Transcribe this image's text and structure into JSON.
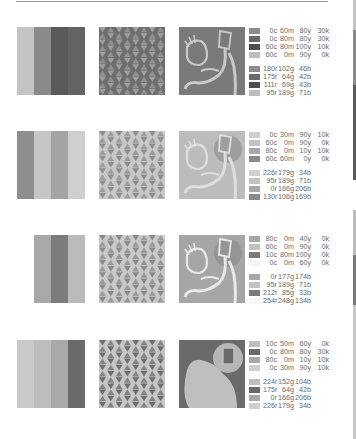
{
  "palettes": [
    {
      "name": "palette-1",
      "stripes": [
        "#c4c4c4",
        "#8a8a8a",
        "#5a5a5a",
        "#646464"
      ],
      "stripe_left": 17,
      "stripe_widths": [
        17,
        17,
        17,
        17
      ],
      "pattern_bg": "#6e6e6e",
      "pattern_fg": "#9e9e9e",
      "figure_bg": "#7a7a7a",
      "figure_fg": "#c8c8c8",
      "cmyk": [
        {
          "swatch": "#8c8c8c",
          "c": "0c",
          "m": "60m",
          "y": "80y",
          "k": "30k"
        },
        {
          "swatch": "#6a6a6a",
          "c": "0c",
          "m": "80m",
          "y": "80y",
          "k": "30k"
        },
        {
          "swatch": "#4e4e4e",
          "c": "60c",
          "m": "80m",
          "y": "100y",
          "k": "10k"
        },
        {
          "swatch": "#bdbdbd",
          "c": "60c",
          "m": "0m",
          "y": "90y",
          "k": "0k"
        }
      ],
      "rgb": [
        {
          "swatch": "#8c8c8c",
          "r": "180r",
          "g": "102g",
          "b": "46b"
        },
        {
          "swatch": "#6a6a6a",
          "r": "175r",
          "g": "64g",
          "b": "42b"
        },
        {
          "swatch": "#4e4e4e",
          "r": "111r",
          "g": "69g",
          "b": "43b"
        },
        {
          "swatch": "#bdbdbd",
          "r": "95r",
          "g": "189g",
          "b": "71b"
        }
      ]
    },
    {
      "name": "palette-2",
      "stripes": [
        "#8e8e8e",
        "#c6c6c6",
        "#a4a4a4",
        "#cfcfcf"
      ],
      "stripe_left": 17,
      "stripe_widths": [
        17,
        17,
        17,
        17
      ],
      "pattern_bg": "#c8c8c8",
      "pattern_fg": "#8e8e8e",
      "figure_bg": "#bcbcbc",
      "figure_fg": "#dedede",
      "cmyk": [
        {
          "swatch": "#cfcfcf",
          "c": "0c",
          "m": "30m",
          "y": "90y",
          "k": "10k"
        },
        {
          "swatch": "#c2c2c2",
          "c": "60c",
          "m": "0m",
          "y": "90y",
          "k": "0k"
        },
        {
          "swatch": "#a8a8a8",
          "c": "80c",
          "m": "0m",
          "y": "10y",
          "k": "10k"
        },
        {
          "swatch": "#8a8a8a",
          "c": "60c",
          "m": "60m",
          "y": "0y",
          "k": "0k"
        }
      ],
      "rgb": [
        {
          "swatch": "#cfcfcf",
          "r": "226r",
          "g": "179g",
          "b": "34b"
        },
        {
          "swatch": "#c2c2c2",
          "r": "95r",
          "g": "189g",
          "b": "71b"
        },
        {
          "swatch": "#a8a8a8",
          "r": "0r",
          "g": "166g",
          "b": "206b"
        },
        {
          "swatch": "#8a8a8a",
          "r": "130r",
          "g": "106g",
          "b": "169b"
        }
      ]
    },
    {
      "name": "palette-3",
      "stripes": [
        "#a8a8a8",
        "#7c7c7c",
        "#bababa"
      ],
      "stripe_left": 34,
      "stripe_widths": [
        17,
        17,
        17
      ],
      "pattern_bg": "#c9c9c9",
      "pattern_fg": "#8a8a8a",
      "figure_bg": "#a6a6a6",
      "figure_fg": "#e8e8e8",
      "cmyk": [
        {
          "swatch": "#a8a8a8",
          "c": "80c",
          "m": "0m",
          "y": "40y",
          "k": "0k"
        },
        {
          "swatch": "#c2c2c2",
          "c": "60c",
          "m": "0m",
          "y": "90y",
          "k": "0k"
        },
        {
          "swatch": "#7a7a7a",
          "c": "10c",
          "m": "80m",
          "y": "100y",
          "k": "0k"
        },
        {
          "swatch": "#f6f6f6",
          "c": "0c",
          "m": "0m",
          "y": "60y",
          "k": "0k"
        }
      ],
      "rgb": [
        {
          "swatch": "#a8a8a8",
          "r": "0r",
          "g": "177g",
          "b": "174b"
        },
        {
          "swatch": "#c2c2c2",
          "r": "95r",
          "g": "189g",
          "b": "71b"
        },
        {
          "swatch": "#7a7a7a",
          "r": "212r",
          "g": "85g",
          "b": "33b"
        },
        {
          "swatch": "#f6f6f6",
          "r": "254r",
          "g": "248g",
          "b": "134b"
        }
      ]
    },
    {
      "name": "palette-4",
      "stripes": [
        "#c9c9c9",
        "#bdbdbd",
        "#a9a9a9",
        "#6a6a6a"
      ],
      "stripe_left": 17,
      "stripe_widths": [
        17,
        17,
        17,
        17
      ],
      "pattern_bg": "#c6c6c6",
      "pattern_fg": "#6e6e6e",
      "figure_bg": "#6a6a6a",
      "figure_fg": "#bfbfbf",
      "cmyk": [
        {
          "swatch": "#bdbdbd",
          "c": "10c",
          "m": "50m",
          "y": "60y",
          "k": "0k"
        },
        {
          "swatch": "#6a6a6a",
          "c": "0c",
          "m": "80m",
          "y": "80y",
          "k": "30k"
        },
        {
          "swatch": "#a8a8a8",
          "c": "80c",
          "m": "0m",
          "y": "10y",
          "k": "10k"
        },
        {
          "swatch": "#cfcfcf",
          "c": "0c",
          "m": "30m",
          "y": "90y",
          "k": "10k"
        }
      ],
      "rgb": [
        {
          "swatch": "#bdbdbd",
          "r": "224r",
          "g": "152g",
          "b": "104b"
        },
        {
          "swatch": "#6a6a6a",
          "r": "175r",
          "g": "64g",
          "b": "42b"
        },
        {
          "swatch": "#a8a8a8",
          "r": "0r",
          "g": "166g",
          "b": "206b"
        },
        {
          "swatch": "#cfcfcf",
          "r": "226r",
          "g": "179g",
          "b": "34b"
        }
      ]
    }
  ],
  "row_tops": [
    27,
    131,
    235,
    340
  ],
  "edge_strip": [
    {
      "color": "#c4c4c4",
      "h": 30
    },
    {
      "color": "#8a8a8a",
      "h": 55
    },
    {
      "color": "#5a5a5a",
      "h": 95
    },
    {
      "color": "#ffffff",
      "h": 30
    },
    {
      "color": "#bdbdbd",
      "h": 45
    },
    {
      "color": "#7a7a7a",
      "h": 50
    },
    {
      "color": "#c8c8c8",
      "h": 134
    }
  ]
}
